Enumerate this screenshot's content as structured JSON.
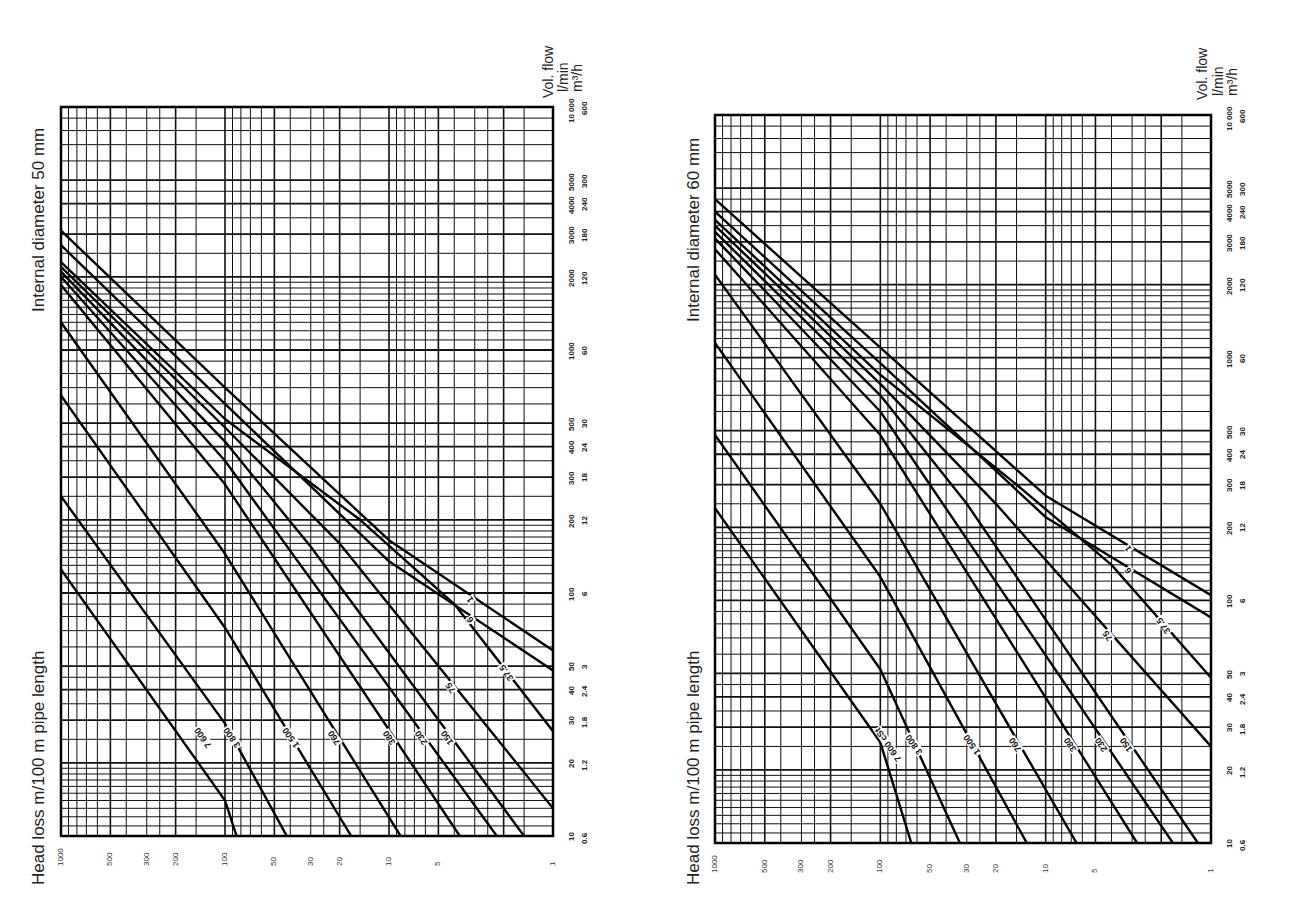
{
  "charts": [
    {
      "id": "left",
      "title": "Internal diameter 50 mm",
      "xaxis_title": "Head loss m/100 m pipe length",
      "yaxis_title": "Vol. flow",
      "yaxis_unit_1": "l/min",
      "yaxis_unit_2": "m³/h"
    },
    {
      "id": "right",
      "title": "Internal diameter 60 mm",
      "xaxis_title": "Head loss m/100 m pipe length",
      "yaxis_title": "Vol. flow",
      "yaxis_unit_1": "l/min",
      "yaxis_unit_2": "m³/h"
    }
  ],
  "axes": {
    "flow_ticks_lmin": [
      "10",
      "20",
      "30",
      "40",
      "50",
      "100",
      "200",
      "300",
      "400",
      "500",
      "1000",
      "2000",
      "3000",
      "4000",
      "5000",
      "10 000"
    ],
    "flow_ticks_m3h": [
      "0.6",
      "1.2",
      "1.8",
      "2.4",
      "3",
      "6",
      "12",
      "18",
      "24",
      "30",
      "60",
      "120",
      "180",
      "240",
      "300",
      "600"
    ],
    "headloss_ticks": [
      "1000",
      "500",
      "300",
      "200",
      "100",
      "50",
      "30",
      "20",
      "10",
      "5",
      "1"
    ]
  },
  "chart_data": [
    {
      "type": "line",
      "title": "Internal diameter 50 mm",
      "xlabel": "Head loss m/100 m pipe length",
      "ylabel": "Vol. flow (l/min | m³/h)",
      "xscale": "log",
      "yscale": "log",
      "xlim": [
        1,
        1000
      ],
      "ylim": [
        10,
        10000
      ],
      "orientation_note": "Printed rotated: head loss axis runs horizontally (1000 at left to 1 at right), flow axis vertically (10 at bottom to 10000 at top)",
      "grid": true,
      "legend": "inline curve labels (viscosity in cSt)",
      "series": [
        {
          "name": "1",
          "points": [
            [
              1000,
              3100
            ],
            [
              100,
              700
            ],
            [
              10,
              165
            ],
            [
              1.0,
              58
            ]
          ]
        },
        {
          "name": "6",
          "points": [
            [
              1000,
              2700
            ],
            [
              100,
              600
            ],
            [
              10,
              135
            ],
            [
              1.0,
              48
            ]
          ]
        },
        {
          "name": "37.5",
          "points": [
            [
              1000,
              2300
            ],
            [
              100,
              520
            ],
            [
              15,
              200
            ],
            [
              4,
              90
            ],
            [
              1.0,
              27
            ]
          ]
        },
        {
          "name": "75",
          "points": [
            [
              1000,
              2200
            ],
            [
              100,
              480
            ],
            [
              20,
              160
            ],
            [
              1.0,
              13
            ]
          ]
        },
        {
          "name": "150",
          "points": [
            [
              1000,
              2100
            ],
            [
              100,
              420
            ],
            [
              30,
              155
            ],
            [
              1.5,
              10
            ]
          ]
        },
        {
          "name": "230",
          "points": [
            [
              1000,
              2000
            ],
            [
              100,
              350
            ],
            [
              2.2,
              10
            ]
          ]
        },
        {
          "name": "380",
          "points": [
            [
              1000,
              1850
            ],
            [
              100,
              280
            ],
            [
              3.7,
              10
            ]
          ]
        },
        {
          "name": "760",
          "points": [
            [
              1000,
              1300
            ],
            [
              100,
              145
            ],
            [
              8.5,
              10
            ]
          ]
        },
        {
          "name": "1 500",
          "points": [
            [
              1000,
              650
            ],
            [
              100,
              72
            ],
            [
              17,
              10
            ]
          ]
        },
        {
          "name": "3 800",
          "points": [
            [
              1000,
              250
            ],
            [
              100,
              29
            ],
            [
              42,
              10
            ]
          ]
        },
        {
          "name": "7 600",
          "points": [
            [
              1000,
              125
            ],
            [
              100,
              14
            ],
            [
              85,
              10
            ]
          ]
        }
      ]
    },
    {
      "type": "line",
      "title": "Internal diameter 60 mm",
      "xlabel": "Head loss m/100 m pipe length",
      "ylabel": "Vol. flow (l/min | m³/h)",
      "xscale": "log",
      "yscale": "log",
      "xlim": [
        1,
        1000
      ],
      "ylim": [
        10,
        10000
      ],
      "orientation_note": "Printed rotated: head loss axis runs horizontally (1000 at left to 1 at right), flow axis vertically (10 at bottom to 10000 at top)",
      "grid": true,
      "legend": "inline curve labels (viscosity in cSt)",
      "series": [
        {
          "name": "1",
          "points": [
            [
              1000,
              4500
            ],
            [
              100,
              1100
            ],
            [
              10,
              270
            ],
            [
              1.0,
              105
            ]
          ]
        },
        {
          "name": "6",
          "points": [
            [
              1000,
              4000
            ],
            [
              100,
              950
            ],
            [
              10,
              220
            ],
            [
              1.0,
              85
            ]
          ]
        },
        {
          "name": "37.5",
          "points": [
            [
              1000,
              3700
            ],
            [
              100,
              850
            ],
            [
              15,
              300
            ],
            [
              4,
              140
            ],
            [
              1.0,
              48
            ]
          ]
        },
        {
          "name": "75",
          "points": [
            [
              1000,
              3500
            ],
            [
              100,
              780
            ],
            [
              20,
              250
            ],
            [
              1.0,
              25
            ]
          ]
        },
        {
          "name": "150",
          "points": [
            [
              1000,
              3300
            ],
            [
              100,
              700
            ],
            [
              30,
              250
            ],
            [
              1.2,
              10
            ]
          ]
        },
        {
          "name": "230",
          "points": [
            [
              1000,
              3100
            ],
            [
              100,
              600
            ],
            [
              1.7,
              10
            ]
          ]
        },
        {
          "name": "380",
          "points": [
            [
              1000,
              2800
            ],
            [
              100,
              480
            ],
            [
              2.8,
              10
            ]
          ]
        },
        {
          "name": "760",
          "points": [
            [
              1000,
              2200
            ],
            [
              100,
              250
            ],
            [
              6.5,
              10
            ]
          ]
        },
        {
          "name": "1 500",
          "points": [
            [
              1000,
              1150
            ],
            [
              100,
              125
            ],
            [
              13,
              10
            ]
          ]
        },
        {
          "name": "3 800",
          "points": [
            [
              1000,
              480
            ],
            [
              100,
              52
            ],
            [
              33,
              10
            ]
          ]
        },
        {
          "name": "7 600 cSt",
          "points": [
            [
              1000,
              240
            ],
            [
              100,
              26
            ],
            [
              65,
              10
            ]
          ]
        }
      ]
    }
  ]
}
